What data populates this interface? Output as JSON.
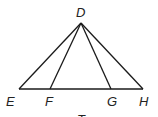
{
  "diagram": {
    "type": "geometry",
    "points": [
      {
        "id": "D",
        "label": "D",
        "x": 81,
        "y": 23,
        "lx": 76,
        "ly": 17
      },
      {
        "id": "E",
        "label": "E",
        "x": 19,
        "y": 89,
        "lx": 6,
        "ly": 106
      },
      {
        "id": "F",
        "label": "F",
        "x": 50,
        "y": 89,
        "lx": 45,
        "ly": 106
      },
      {
        "id": "G",
        "label": "G",
        "x": 111,
        "y": 89,
        "lx": 107,
        "ly": 106
      },
      {
        "id": "H",
        "label": "H",
        "x": 143,
        "y": 89,
        "lx": 139,
        "ly": 106
      }
    ],
    "segments": [
      [
        "E",
        "H"
      ],
      [
        "D",
        "E"
      ],
      [
        "D",
        "F"
      ],
      [
        "D",
        "G"
      ],
      [
        "D",
        "H"
      ]
    ],
    "caption_partial": "T",
    "stroke_color": "#1a1a1a"
  }
}
